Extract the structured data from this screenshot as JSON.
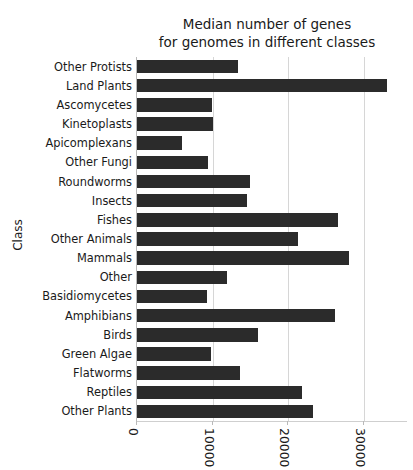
{
  "chart_data": {
    "type": "bar",
    "orientation": "horizontal",
    "title": "Median number of genes\nfor genomes in different classes",
    "xlabel": "",
    "ylabel": "Class",
    "xlim": [
      0,
      35700
    ],
    "grid": "x-only",
    "legend": "none",
    "bar_color": "#2b2b2b",
    "xticks": [
      0,
      10000,
      20000,
      30000
    ],
    "xticklabels": [
      "0",
      "10000",
      "20000",
      "30000"
    ],
    "xticklabels_rotation": 90,
    "xticklabels_clipped": true,
    "categories": [
      "Other Protists",
      "Land Plants",
      "Ascomycetes",
      "Kinetoplasts",
      "Apicomplexans",
      "Other Fungi",
      "Roundworms",
      "Insects",
      "Fishes",
      "Other Animals",
      "Mammals",
      "Other",
      "Basidiomycetes",
      "Amphibians",
      "Birds",
      "Green Algae",
      "Flatworms",
      "Reptiles",
      "Other Plants"
    ],
    "values": [
      13400,
      33100,
      9900,
      10000,
      6000,
      9400,
      15000,
      14600,
      26600,
      21300,
      28000,
      11900,
      9300,
      26200,
      16000,
      9800,
      13600,
      21800,
      23300
    ]
  }
}
